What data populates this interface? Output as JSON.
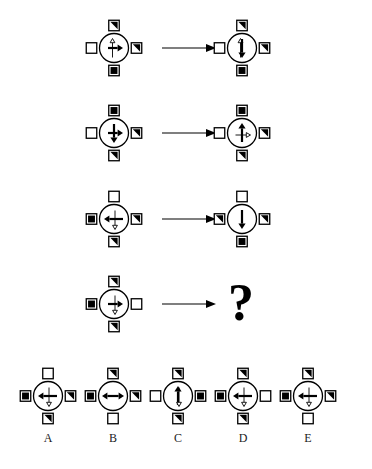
{
  "puzzle": {
    "type": "visual-analogy-matrix",
    "title": "",
    "question_mark": "?",
    "transition_arrow": "→",
    "rows": [
      {
        "name": "row-1",
        "left": {
          "name": "row-1-left",
          "circle": {
            "inner_arrows": [
              "up-thin-outline",
              "right-solid"
            ]
          },
          "squares": {
            "top": "half-black-diag",
            "right": "half-black-diag",
            "bottom": "solid-black",
            "left": "white-empty"
          }
        },
        "right": {
          "name": "row-1-right",
          "circle": {
            "inner_arrows": [
              "up-thin-outline",
              "down-solid"
            ]
          },
          "squares": {
            "top": "half-black-diag",
            "right": "half-black-diag",
            "bottom": "solid-black",
            "left": "white-empty"
          }
        }
      },
      {
        "name": "row-2",
        "left": {
          "name": "row-2-left",
          "circle": {
            "inner_arrows": [
              "right-solid",
              "down-solid"
            ]
          },
          "squares": {
            "top": "solid-black",
            "right": "half-black-diag",
            "bottom": "half-black-diag",
            "left": "white-empty"
          }
        },
        "right": {
          "name": "row-2-right",
          "circle": {
            "inner_arrows": [
              "up-solid",
              "right-thin-outline"
            ]
          },
          "squares": {
            "top": "solid-black",
            "right": "half-black-diag",
            "bottom": "half-black-diag",
            "left": "white-empty"
          }
        }
      },
      {
        "name": "row-3",
        "left": {
          "name": "row-3-left",
          "circle": {
            "inner_arrows": [
              "left-solid",
              "down-thin-outline"
            ]
          },
          "squares": {
            "top": "white-empty",
            "right": "half-black-diag",
            "bottom": "half-black-diag",
            "left": "solid-black"
          }
        },
        "right": {
          "name": "row-3-right",
          "circle": {
            "inner_arrows": [
              "down-solid"
            ]
          },
          "squares": {
            "top": "white-empty",
            "right": "half-black-diag",
            "bottom": "solid-black",
            "left": "half-black-diag"
          }
        }
      },
      {
        "name": "row-4",
        "left": {
          "name": "row-4-left",
          "circle": {
            "inner_arrows": [
              "right-solid",
              "down-thin-outline"
            ]
          },
          "squares": {
            "top": "half-black-diag",
            "right": "white-empty",
            "bottom": "half-black-diag",
            "left": "solid-black"
          }
        },
        "right": {
          "name": "row-4-right-unknown",
          "is_unknown": true
        }
      }
    ],
    "options": [
      {
        "name": "option-a",
        "label": "A",
        "circle": {
          "inner_arrows": [
            "left-solid",
            "down-thin-outline"
          ]
        },
        "squares": {
          "top": "white-empty",
          "right": "half-black-diag",
          "bottom": "half-black-diag",
          "left": "solid-black"
        }
      },
      {
        "name": "option-b",
        "label": "B",
        "circle": {
          "inner_arrows": [
            "left-right-double-solid"
          ]
        },
        "squares": {
          "top": "half-black-diag",
          "right": "half-black-diag",
          "bottom": "white-empty",
          "left": "solid-black"
        }
      },
      {
        "name": "option-c",
        "label": "C",
        "circle": {
          "inner_arrows": [
            "up-solid",
            "down-thin-outline"
          ]
        },
        "squares": {
          "top": "half-black-diag",
          "right": "solid-black",
          "bottom": "half-black-diag",
          "left": "white-empty"
        }
      },
      {
        "name": "option-d",
        "label": "D",
        "circle": {
          "inner_arrows": [
            "left-solid",
            "down-thin-outline"
          ]
        },
        "squares": {
          "top": "half-black-diag",
          "right": "white-empty",
          "bottom": "half-black-diag",
          "left": "solid-black"
        }
      },
      {
        "name": "option-e",
        "label": "E",
        "circle": {
          "inner_arrows": [
            "left-solid",
            "down-thin-outline"
          ]
        },
        "squares": {
          "top": "half-black-diag",
          "right": "half-black-diag",
          "bottom": "white-empty",
          "left": "solid-black"
        }
      }
    ],
    "colors": {
      "ink": "#000000",
      "background": "#ffffff",
      "label_text": "#1b1b1b"
    }
  }
}
